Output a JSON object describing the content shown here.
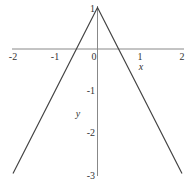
{
  "chart_data": {
    "type": "line",
    "title": "",
    "xlabel": "x",
    "ylabel": "y",
    "xlim": [
      -2,
      2
    ],
    "ylim": [
      -3,
      1
    ],
    "grid": false,
    "x_ticks": [
      "-2",
      "-1",
      "0",
      "1",
      "2"
    ],
    "y_ticks": [
      "1",
      "-1",
      "-2",
      "-3"
    ],
    "series": [
      {
        "name": "y = 1 - 2|x|",
        "x": [
          -2,
          -1,
          -0.5,
          0,
          0.5,
          1,
          2
        ],
        "y": [
          -3,
          -1,
          0,
          1,
          0,
          -1,
          -3
        ]
      }
    ],
    "line_color": "#444444",
    "axis_color": "#888888"
  }
}
